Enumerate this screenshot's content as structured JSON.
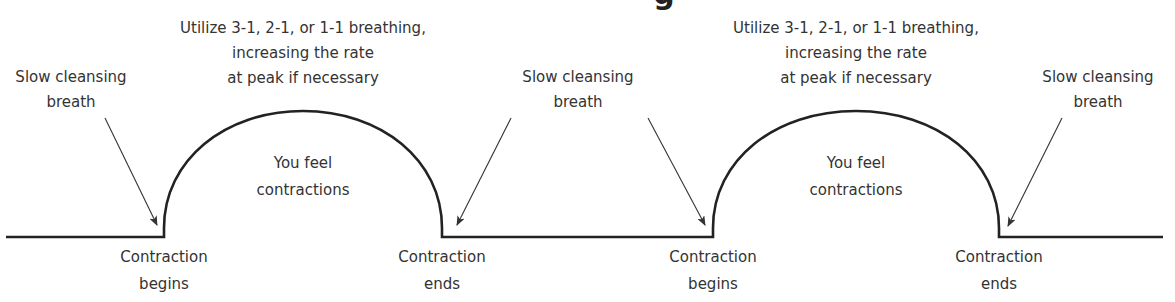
{
  "diagram": {
    "title_fragment": "g",
    "colors": {
      "line": "#222222",
      "text": "#333333",
      "background": "#ffffff"
    },
    "baseline": {
      "y": 237,
      "x_start": 6,
      "x_end": 1163
    },
    "humps": [
      {
        "x_start": 164,
        "x_end": 442,
        "peak_y": 111,
        "peak_label": {
          "line1": "Utilize 3-1, 2-1, or 1-1 breathing,",
          "line2": "increasing the rate",
          "line3": "at peak if necessary"
        },
        "inner_label": {
          "line1": "You feel",
          "line2": "contractions"
        },
        "start_label": {
          "line1": "Contraction",
          "line2": "begins"
        },
        "end_label": {
          "line1": "Contraction",
          "line2": "ends"
        }
      },
      {
        "x_start": 713,
        "x_end": 999,
        "peak_y": 111,
        "peak_label": {
          "line1": "Utilize 3-1, 2-1, or 1-1 breathing,",
          "line2": "increasing the rate",
          "line3": "at peak if necessary"
        },
        "inner_label": {
          "line1": "You feel",
          "line2": "contractions"
        },
        "start_label": {
          "line1": "Contraction",
          "line2": "begins"
        },
        "end_label": {
          "line1": "Contraction",
          "line2": "ends"
        }
      }
    ],
    "breath_labels": [
      {
        "line1": "Slow cleansing",
        "line2": "breath"
      },
      {
        "line1": "Slow cleansing",
        "line2": "breath"
      },
      {
        "line1": "Slow cleansing",
        "line2": "breath"
      }
    ]
  }
}
